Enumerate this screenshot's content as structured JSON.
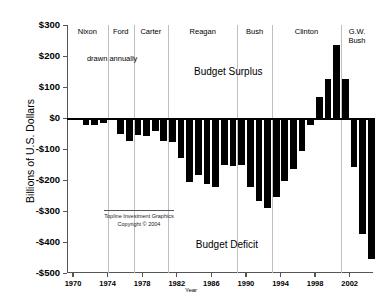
{
  "chart_data": {
    "type": "bar",
    "title": "",
    "xlabel": "Year",
    "ylabel": "Billions of U.S. Dollars",
    "ylim": [
      -500,
      300
    ],
    "xlim": [
      1969.3,
      2004.7
    ],
    "grid": false,
    "legend": "none",
    "bar_color": "#000000",
    "ytick_labels": [
      "$300",
      "$200",
      "$100",
      "$0",
      "-$100",
      "-$200",
      "-$300",
      "-$400",
      "-$500"
    ],
    "ytick_values": [
      300,
      200,
      100,
      0,
      -100,
      -200,
      -300,
      -400,
      -500
    ],
    "xtick_labels": [
      "1970",
      "1974",
      "1978",
      "1982",
      "1986",
      "1990",
      "1994",
      "1998",
      "2002"
    ],
    "xtick_values": [
      1970,
      1974,
      1978,
      1982,
      1986,
      1990,
      1994,
      1998,
      2002
    ],
    "categories": [
      1970,
      1971,
      1972,
      1973,
      1974,
      1975,
      1976,
      1977,
      1978,
      1979,
      1980,
      1981,
      1982,
      1983,
      1984,
      1985,
      1986,
      1987,
      1988,
      1989,
      1990,
      1991,
      1992,
      1993,
      1994,
      1995,
      1996,
      1997,
      1998,
      1999,
      2000,
      2001,
      2002,
      2003,
      2004
    ],
    "values": [
      -3,
      -23,
      -23,
      -15,
      -6,
      -53,
      -74,
      -54,
      -59,
      -41,
      -74,
      -79,
      -128,
      -208,
      -185,
      -212,
      -221,
      -150,
      -155,
      -153,
      -221,
      -269,
      -290,
      -255,
      -203,
      -164,
      -107,
      -22,
      69,
      125,
      236,
      127,
      -158,
      -375,
      -455
    ],
    "annotations": [
      {
        "id": "drawn-annually",
        "text": "drawn annually",
        "x": 1971.6,
        "y": 207
      },
      {
        "id": "budget-surplus",
        "text": "Budget Surplus",
        "x": 1984.0,
        "y": 168
      },
      {
        "id": "budget-deficit",
        "text": "Budget Deficit",
        "x": 1984.2,
        "y": -390
      }
    ],
    "eras": [
      {
        "label": "Nixon",
        "start": 1969.3,
        "end": 1974.0
      },
      {
        "label": "Ford",
        "start": 1974.0,
        "end": 1977.0
      },
      {
        "label": "Carter",
        "start": 1977.0,
        "end": 1981.0
      },
      {
        "label": "Reagan",
        "start": 1981.0,
        "end": 1989.0
      },
      {
        "label": "Bush",
        "start": 1989.0,
        "end": 1993.0
      },
      {
        "label": "Clinton",
        "start": 1993.0,
        "end": 2001.0
      },
      {
        "label": "G.W.\nBush",
        "start": 2001.0,
        "end": 2004.7
      }
    ],
    "credit": {
      "line1": "Topline Investment Graphics",
      "line2": "Copyright © 2004"
    }
  }
}
